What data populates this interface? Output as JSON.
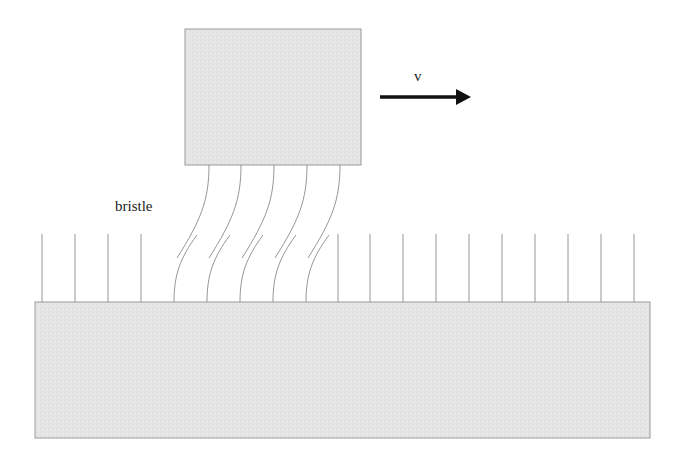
{
  "diagram": {
    "title": "",
    "labels": {
      "bristle": "bristle",
      "velocity": "v"
    },
    "colors": {
      "block_fill": "#e6e6e6",
      "block_stroke": "#9a9a9a",
      "bristle_stroke": "#8a8a8a",
      "arrow": "#111111"
    },
    "upper_block": {
      "x": 185,
      "y": 29,
      "width": 176,
      "height": 136
    },
    "lower_block": {
      "x": 35,
      "y": 302,
      "width": 615,
      "height": 136
    },
    "arrow": {
      "x1": 380,
      "y1": 97,
      "x2": 470,
      "y2": 97,
      "direction": "right"
    },
    "straight_bristles_x": [
      42,
      75,
      108,
      141,
      338,
      370,
      403,
      436,
      469,
      502,
      535,
      568,
      601,
      634
    ],
    "deflected_bristles_top_x": [
      209,
      241,
      274,
      307,
      340
    ],
    "deflected_bristles_bottom_x": [
      174,
      207,
      240,
      273,
      306
    ]
  }
}
